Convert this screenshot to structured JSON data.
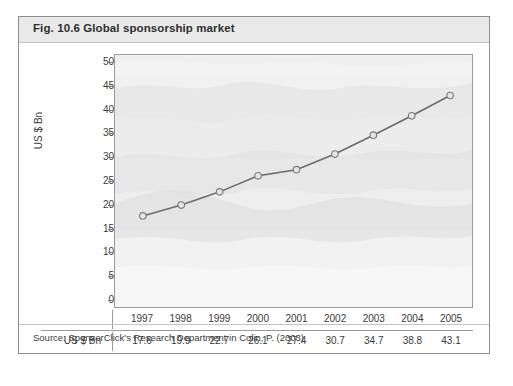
{
  "figure": {
    "title": "Fig. 10.6  Global sponsorship market",
    "source": "Source: SponsorClick's Research Department in Colin, P. (2003)"
  },
  "table": {
    "row_label": "US $ Bn",
    "years": [
      "1997",
      "1998",
      "1999",
      "2000",
      "2001",
      "2002",
      "2003",
      "2004",
      "2005"
    ],
    "values": [
      "17.6",
      "19.9",
      "22.7",
      "26.1",
      "27.4",
      "30.7",
      "34.7",
      "38.8",
      "43.1"
    ]
  },
  "axis": {
    "y_title": "US $ Bn",
    "y_ticks": [
      "50",
      "45",
      "40",
      "35",
      "30",
      "25",
      "20",
      "15",
      "10",
      "5",
      "0"
    ]
  },
  "colors": {
    "line": "#6b6b6b",
    "marker_fill": "#e4e4e4",
    "marker_stroke": "#7a7a7a",
    "frame": "#9a9a9a",
    "title_band": "#e9e9e9",
    "text": "#3a3a3a",
    "plot_bg": "#f2f2f2"
  },
  "chart_data": {
    "type": "line",
    "title": "Global sponsorship market",
    "xlabel": "",
    "ylabel": "US $ Bn",
    "categories": [
      "1997",
      "1998",
      "1999",
      "2000",
      "2001",
      "2002",
      "2003",
      "2004",
      "2005"
    ],
    "values": [
      17.6,
      19.9,
      22.7,
      26.1,
      27.4,
      30.7,
      34.7,
      38.8,
      43.1
    ],
    "ylim": [
      0,
      50
    ],
    "ytick_step": 5,
    "grid": false,
    "legend": false,
    "marker": "open-circle",
    "source": "SponsorClick's Research Department in Colin, P. (2003)"
  }
}
